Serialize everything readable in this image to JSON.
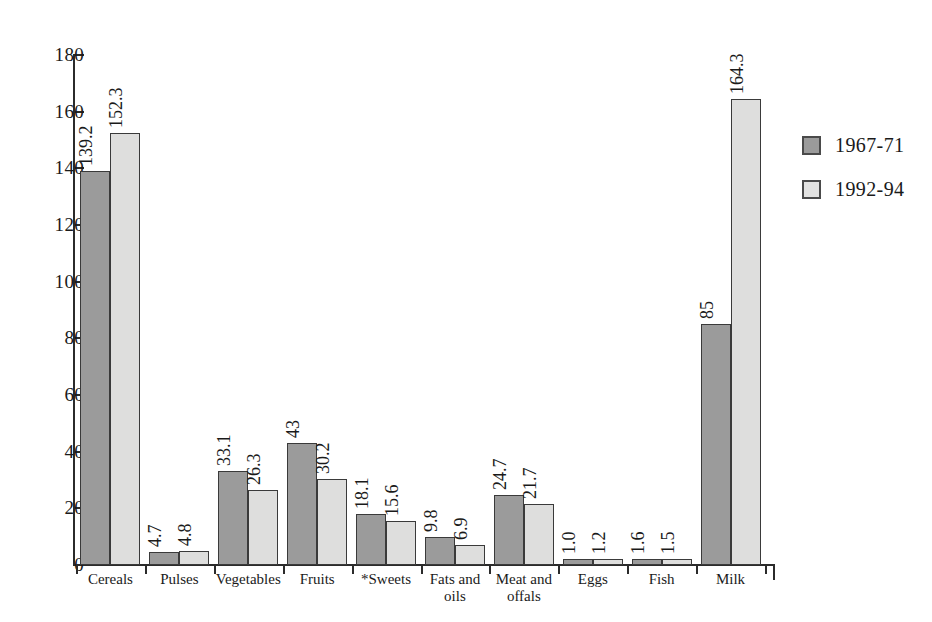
{
  "chart_data": {
    "type": "bar",
    "title": "",
    "xlabel": "",
    "ylabel": "",
    "ylim": [
      0,
      180
    ],
    "yticks": [
      0,
      20,
      40,
      60,
      80,
      100,
      120,
      140,
      160,
      180
    ],
    "grid": false,
    "legend_position": "right",
    "categories": [
      "Cereals",
      "Pulses",
      "Vegetables",
      "Fruits",
      "*Sweets",
      "Fats and oils",
      "Meat and offals",
      "Eggs",
      "Fish",
      "Milk"
    ],
    "series": [
      {
        "name": "1967-71",
        "color": "#9b9b9b",
        "values": [
          139.2,
          4.7,
          33.1,
          43,
          18.1,
          9.8,
          24.7,
          1.0,
          1.6,
          85
        ],
        "labels": [
          "139.2",
          "4.7",
          "33.1",
          "43",
          "18.1",
          "9.8",
          "24.7",
          "1.0",
          "1.6",
          "85"
        ]
      },
      {
        "name": "1992-94",
        "color": "#dededd",
        "values": [
          152.3,
          4.8,
          26.3,
          30.2,
          15.6,
          6.9,
          21.7,
          1.2,
          1.5,
          164.3
        ],
        "labels": [
          "152.3",
          "4.8",
          "26.3",
          "30.2",
          "15.6",
          "6.9",
          "21.7",
          "1.2",
          "1.5",
          "164.3"
        ]
      }
    ]
  },
  "legend": {
    "items": [
      {
        "label": "1967-71",
        "series": 0
      },
      {
        "label": "1992-94",
        "series": 1
      }
    ]
  }
}
